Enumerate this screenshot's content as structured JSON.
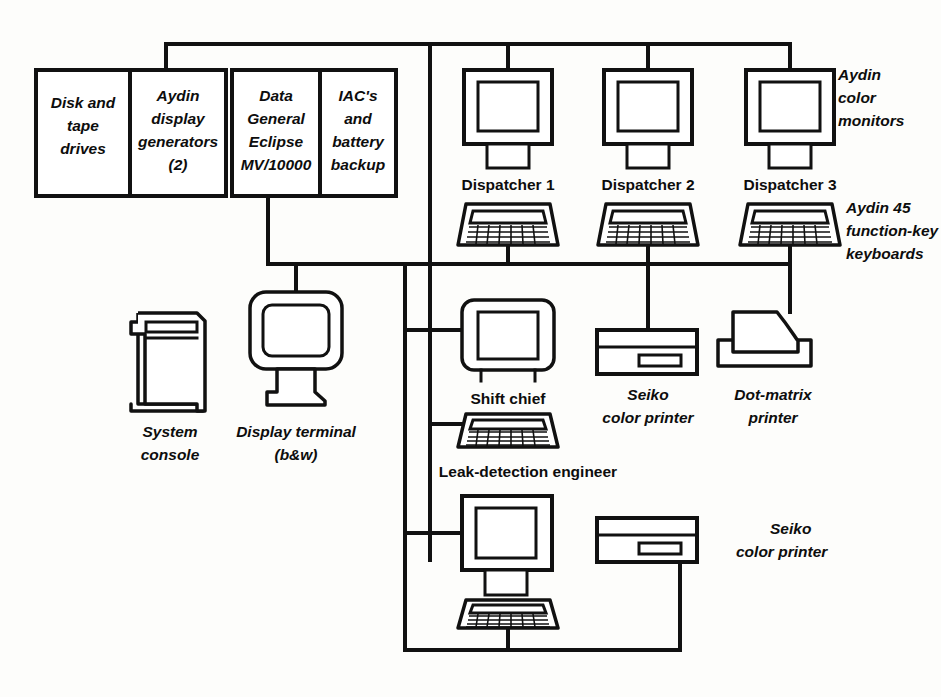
{
  "diagram": {
    "colors": {
      "ink": "#111111",
      "paper": "#fdfdfb"
    },
    "equipment_boxes": [
      {
        "id": "disk-tape-drives",
        "lines": [
          "Disk and",
          "tape",
          "drives"
        ]
      },
      {
        "id": "aydin-display-generators",
        "lines": [
          "Aydin",
          "display",
          "generators",
          "(2)"
        ]
      },
      {
        "id": "data-general-eclipse",
        "lines": [
          "Data",
          "General",
          "Eclipse",
          "MV/10000"
        ]
      },
      {
        "id": "iac-battery-backup",
        "lines": [
          "IAC's",
          "and",
          "battery",
          "backup"
        ]
      }
    ],
    "workstations": [
      {
        "id": "dispatcher-1",
        "label": "Dispatcher 1"
      },
      {
        "id": "dispatcher-2",
        "label": "Dispatcher 2"
      },
      {
        "id": "dispatcher-3",
        "label": "Dispatcher 3"
      }
    ],
    "annotations": {
      "aydin_color_monitors": [
        "Aydin",
        "color",
        "monitors"
      ],
      "aydin_keyboards": [
        "Aydin 45",
        "function-key",
        "keyboards"
      ],
      "system_console": [
        "System",
        "console"
      ],
      "display_terminal": [
        "Display terminal",
        "(b&w)"
      ],
      "seiko_printer_top": [
        "Seiko",
        "color printer"
      ],
      "dot_matrix_printer": [
        "Dot-matrix",
        "printer"
      ],
      "seiko_printer_bottom": [
        "Seiko",
        "color printer"
      ]
    },
    "operator_labels": {
      "shift_chief": "Shift chief",
      "leak_detection_engineer": "Leak-detection engineer"
    }
  }
}
